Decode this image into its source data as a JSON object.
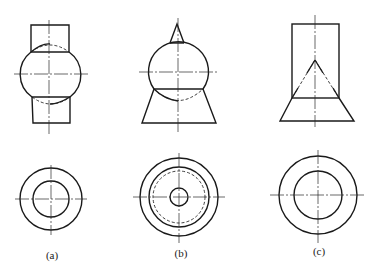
{
  "figure": {
    "views": [
      {
        "label": "(a)",
        "front_view": "Sphere penetrated by a vertical cylinder; hidden intersection arcs",
        "top_view": "Two concentric circles with centerlines"
      },
      {
        "label": "(b)",
        "front_view": "Sphere with a small cone on top and a truncated cone (frustum) below; hidden arc",
        "top_view": "Three concentric solid circles plus one dashed hidden circle with centerlines"
      },
      {
        "label": "(c)",
        "front_view": "Cylinder on top of a frustum with a hidden inner cone",
        "top_view": "Two concentric circles with centerlines"
      }
    ]
  },
  "labels": {
    "a": "(a)",
    "b": "(b)",
    "c": "(c)"
  },
  "colors": {
    "line": "#1a1a1a",
    "background": "#ffffff"
  }
}
